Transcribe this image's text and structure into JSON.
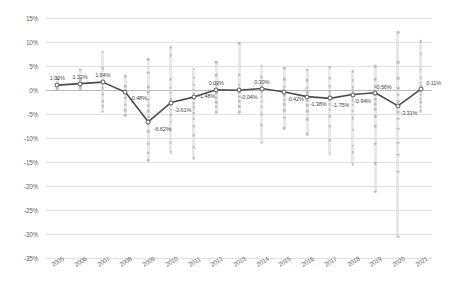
{
  "chart_data": {
    "type": "scatter",
    "title": "",
    "xlabel": "",
    "ylabel": "",
    "ylim": [
      -35,
      15
    ],
    "ytick_step": 5,
    "ytick_labels": [
      "15%",
      "10%",
      "5%",
      "0%",
      "-5%",
      "-10%",
      "-15%",
      "-20%",
      "-25%",
      "-30%",
      "-35%"
    ],
    "ytick_values": [
      15,
      10,
      5,
      0,
      -5,
      -10,
      -15,
      -20,
      -25,
      -30,
      -35
    ],
    "grid": true,
    "legend": "none",
    "categories": [
      "2005",
      "2006",
      "2007",
      "2008",
      "2009",
      "2010",
      "2011",
      "2012",
      "2013",
      "2014",
      "2015",
      "2016",
      "2017",
      "2018",
      "2019",
      "2020",
      "2021"
    ],
    "series": [
      {
        "name": "Average",
        "type": "line",
        "color": "#4d4d4d",
        "values": [
          1.02,
          1.32,
          1.64,
          -0.48,
          -6.62,
          -2.61,
          -1.48,
          0.03,
          -0.04,
          0.3,
          -0.42,
          -1.38,
          -1.75,
          -0.94,
          -0.56,
          -3.31,
          0.11
        ],
        "data_labels": [
          "1.02%",
          "1.32%",
          "1.64%",
          "-0.48%",
          "-6.62%",
          "-2.61%",
          "-1.48%",
          "0.03%",
          "-0.04%",
          "0.30%",
          "-0.42%",
          "-1.38%",
          "-1.75%",
          "-0.94%",
          "-0.56%",
          "-3.31%",
          "0.11%"
        ]
      },
      {
        "name": "Observations",
        "type": "scatter",
        "color": "#bdbdbd",
        "points_by_year": {
          "2005": [
            1.0,
            0.2,
            2.4
          ],
          "2006": [
            4.2,
            2.1,
            0.6,
            0.1
          ],
          "2007": [
            8.0,
            4.6,
            1.9,
            1.3,
            0.4,
            -0.9,
            -2.3,
            -3.4,
            -4.5
          ],
          "2008": [
            2.9,
            0.8,
            -0.5,
            -1.6,
            -3.1,
            -4.2,
            -5.3
          ],
          "2009": [
            6.4,
            3.6,
            0.6,
            -0.4,
            -2.0,
            -3.3,
            -4.4,
            -5.6,
            -7.0,
            -8.6,
            -11.2,
            -13.1,
            -14.6
          ],
          "2010": [
            8.9,
            7.2,
            2.3,
            0.5,
            -0.6,
            -1.9,
            -3.0,
            -4.1,
            -5.3,
            -6.6,
            -8.2,
            -11.0,
            -13.0
          ],
          "2011": [
            4.4,
            2.6,
            1.1,
            0.1,
            -0.8,
            -1.8,
            -2.7,
            -3.6,
            -4.8,
            -6.0,
            -7.6,
            -9.4,
            -11.9,
            -14.2
          ],
          "2012": [
            5.8,
            3.1,
            1.2,
            0.2,
            -0.7,
            -1.6,
            -2.6,
            -3.5,
            -4.6
          ],
          "2013": [
            9.7,
            3.2,
            1.1,
            0.3,
            -0.5,
            -1.4,
            -2.3,
            -3.4,
            -4.6
          ],
          "2014": [
            5.1,
            2.7,
            0.9,
            0.2,
            -0.6,
            -1.4,
            -2.4,
            -3.5,
            -5.0,
            -7.3,
            -11.0
          ],
          "2015": [
            4.5,
            2.2,
            0.7,
            -0.3,
            -1.1,
            -2.0,
            -3.0,
            -4.2,
            -5.8,
            -8.0
          ],
          "2016": [
            4.2,
            2.0,
            0.5,
            -0.5,
            -1.3,
            -2.2,
            -3.2,
            -4.4,
            -6.1,
            -9.2
          ],
          "2017": [
            4.7,
            2.4,
            0.8,
            -0.2,
            -1.1,
            -2.0,
            -3.0,
            -4.1,
            -5.5,
            -7.6,
            -10.5,
            -13.3
          ],
          "2018": [
            3.9,
            2.1,
            0.6,
            -0.3,
            -1.2,
            -2.1,
            -3.1,
            -4.3,
            -5.9,
            -8.3,
            -11.6,
            -13.0,
            -15.5
          ],
          "2019": [
            5.0,
            2.3,
            0.8,
            -0.2,
            -1.0,
            -1.9,
            -2.9,
            -4.0,
            -5.4,
            -7.5,
            -11.2,
            -15.3,
            -21.2
          ],
          "2020": [
            12.0,
            5.8,
            2.4,
            0.4,
            -1.0,
            -2.3,
            -3.4,
            -4.6,
            -6.0,
            -8.1,
            -11.0,
            -13.5,
            -17.0,
            -30.6
          ],
          "2021": [
            10.2,
            7.6,
            4.2,
            2.6,
            1.5,
            0.8,
            0.3,
            -0.3,
            -1.0,
            -1.8,
            -2.6,
            -3.5,
            -4.4
          ]
        }
      }
    ]
  },
  "axis": {
    "y_title": "",
    "x_title": ""
  }
}
